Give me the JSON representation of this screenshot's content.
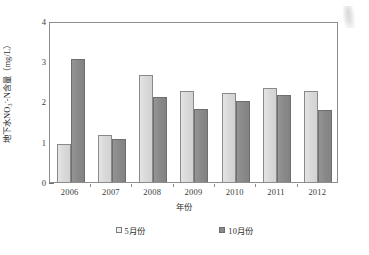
{
  "chart_data": {
    "type": "bar",
    "title": "",
    "xlabel": "年份",
    "ylabel": "地下水NO3--N含量（mg/L）",
    "ylabel_parts": {
      "prefix": "地下水NO",
      "sub": "3",
      "sup": "-",
      "suffix": "-N含量（mg/L）"
    },
    "categories": [
      "2006",
      "2007",
      "2008",
      "2009",
      "2010",
      "2011",
      "2012"
    ],
    "series": [
      {
        "name": "5月份",
        "values": [
          0.95,
          1.17,
          2.65,
          2.27,
          2.2,
          2.33,
          2.25
        ],
        "color": "#dcdcdc"
      },
      {
        "name": "10月份",
        "values": [
          3.05,
          1.08,
          2.11,
          1.82,
          2.01,
          2.16,
          1.79
        ],
        "color": "#8a8a8a"
      }
    ],
    "ylim": [
      0,
      4
    ],
    "yticks": [
      "0",
      "1",
      "2",
      "3",
      "4"
    ],
    "grid": false,
    "legend_position": "bottom"
  },
  "axes": {
    "y_tick_labels": [
      "4",
      "3",
      "2",
      "1",
      "0"
    ]
  }
}
